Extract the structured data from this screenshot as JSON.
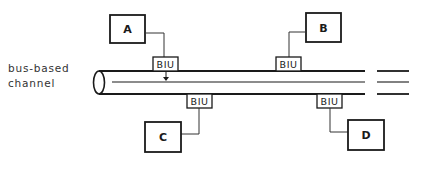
{
  "diagram": {
    "type": "bus network diagram",
    "channel_label_line1": "bus-based",
    "channel_label_line2": "channel",
    "stations": [
      {
        "id": "A",
        "label": "A",
        "side": "top"
      },
      {
        "id": "B",
        "label": "B",
        "side": "top"
      },
      {
        "id": "C",
        "label": "C",
        "side": "bottom"
      },
      {
        "id": "D",
        "label": "D",
        "side": "bottom"
      }
    ],
    "interfaces": [
      {
        "label": "BIU",
        "connects": "A"
      },
      {
        "label": "BIU",
        "connects": "B"
      },
      {
        "label": "BIU",
        "connects": "C"
      },
      {
        "label": "BIU",
        "connects": "D"
      }
    ],
    "colors": {
      "line": "#1a1a1a",
      "background": "#ffffff"
    }
  }
}
